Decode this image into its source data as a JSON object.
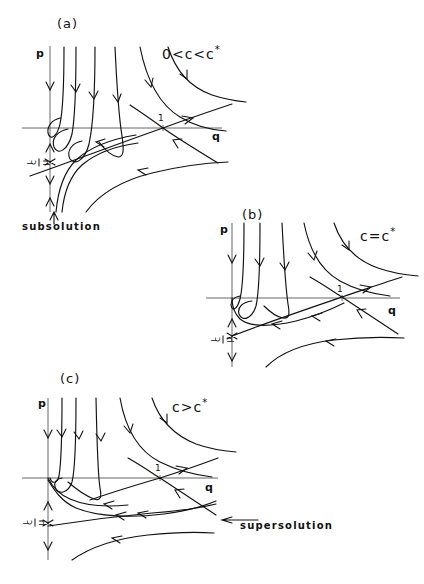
{
  "figure": {
    "type": "phase-portrait-diagram",
    "axis_labels": {
      "horizontal": "q",
      "vertical": "p"
    },
    "tick_label_q": "1",
    "vertical_tick": {
      "minus": "−",
      "numerator": "c",
      "denominator": "μ"
    }
  },
  "panels": [
    {
      "tag": "(a)",
      "condition_prefix": "0<c<c",
      "condition_star": "*",
      "condition_full": "0<c<c*",
      "annotation": "subsolution",
      "annotation_position": "below-left"
    },
    {
      "tag": "(b)",
      "condition_prefix": "c=c",
      "condition_star": "*",
      "condition_full": "c=c*",
      "annotation": "",
      "annotation_position": ""
    },
    {
      "tag": "(c)",
      "condition_prefix": "c>c",
      "condition_star": "*",
      "condition_full": "c>c*",
      "annotation": "supersolution",
      "annotation_position": "right"
    }
  ],
  "colors": {
    "ink": "#111111",
    "axis": "#555555",
    "background": "#ffffff"
  }
}
